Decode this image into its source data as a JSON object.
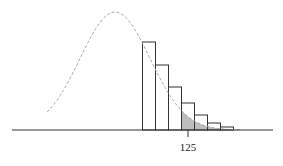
{
  "chart_data": {
    "type": "bar",
    "title": "",
    "xlabel": "",
    "ylabel": "",
    "categories": [
      "122",
      "123",
      "124",
      "125",
      "126",
      "127",
      "128"
    ],
    "values": [
      88,
      65,
      43,
      27,
      15,
      7,
      3
    ],
    "value_units": "relative bar height (px above axis)",
    "shaded_from": 124.5,
    "tick_labels": [
      {
        "value": 125,
        "label": "125"
      }
    ],
    "curve": {
      "style": "dashed",
      "color": "#aaaaaa",
      "type": "normal",
      "peak_x_px": 115,
      "peak_y_px": 12
    },
    "grid": false,
    "legend": null
  },
  "colors": {
    "bar_stroke": "#333333",
    "bar_fill": "#ffffff",
    "shade_fill": "#bdbdbd",
    "curve": "#a8a8a8",
    "axis": "#333333"
  },
  "axis": {
    "tick_label": "125"
  }
}
